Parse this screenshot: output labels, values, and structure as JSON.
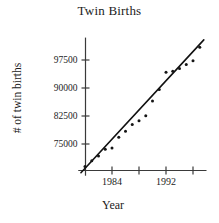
{
  "chart_data": {
    "type": "scatter",
    "title": "Twin Births",
    "xlabel": "Year",
    "ylabel": "# of twin births",
    "grid": false,
    "legend": null,
    "xlim": [
      1979,
      1998
    ],
    "ylim": [
      66500,
      103500
    ],
    "x_ticks": [
      1984,
      1988,
      1992,
      1996
    ],
    "x_tick_labels": [
      "1984",
      "",
      "1992",
      ""
    ],
    "y_ticks": [
      75000,
      82500,
      90000,
      97500
    ],
    "y_tick_labels": [
      "75000",
      "82500",
      "90000",
      "97500"
    ],
    "x": [
      1980,
      1981,
      1982,
      1983,
      1984,
      1985,
      1986,
      1987,
      1988,
      1989,
      1990,
      1991,
      1992,
      1993,
      1994,
      1995,
      1996,
      1997
    ],
    "y": [
      69000,
      70500,
      71800,
      73600,
      73900,
      76800,
      78400,
      80200,
      81200,
      82600,
      86500,
      89600,
      94200,
      94500,
      95200,
      96300,
      97300,
      100900
    ],
    "series": [
      {
        "name": "# of twin births",
        "marker": "dot",
        "color": "#151515",
        "values": [
          69000,
          70500,
          71800,
          73600,
          73900,
          76800,
          78400,
          80200,
          81200,
          82600,
          86500,
          89600,
          94200,
          94500,
          95200,
          96300,
          97300,
          100900
        ]
      }
    ],
    "trend_line": {
      "type": "linear-fit",
      "color": "#111111",
      "x_start": 1979.4,
      "y_start": 67300,
      "x_end": 1997.6,
      "y_end": 102900
    }
  },
  "axes": {
    "y_axis_name": "y-axis",
    "x_axis_name": "x-axis"
  }
}
